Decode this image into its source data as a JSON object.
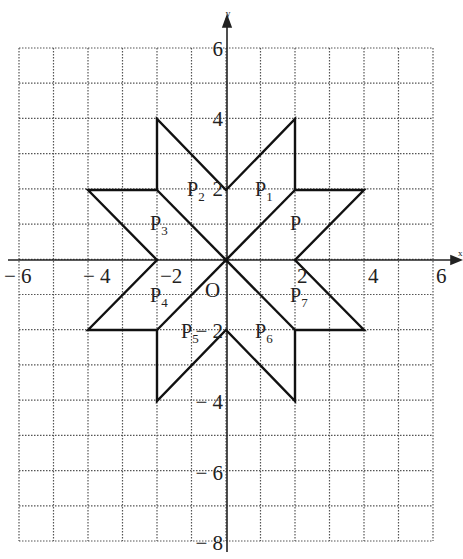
{
  "figure": {
    "type": "coordinate-grid-diagram",
    "x_axis": {
      "name": "x",
      "min": -6,
      "max": 6,
      "tick_labels": [
        "− 6",
        "− 4",
        "−2",
        "2",
        "4",
        "6"
      ],
      "tick_values": [
        -6,
        -4,
        -2,
        2,
        4,
        6
      ]
    },
    "y_axis": {
      "name": "y",
      "min": -8,
      "max": 6,
      "tick_labels": [
        "6",
        "4",
        "2",
        "− 2",
        "− 4",
        "− 6",
        "− 8"
      ],
      "tick_values": [
        6,
        4,
        2,
        -2,
        -4,
        -6,
        -8
      ]
    },
    "origin_label": "O",
    "grid": "dotted, 1 unit spacing",
    "star_outline": [
      [
        0,
        2
      ],
      [
        2,
        4
      ],
      [
        2,
        2
      ],
      [
        4,
        2
      ],
      [
        2,
        0
      ],
      [
        4,
        -2
      ],
      [
        2,
        -2
      ],
      [
        2,
        -4
      ],
      [
        0,
        -2
      ],
      [
        -2,
        -4
      ],
      [
        -2,
        -2
      ],
      [
        -4,
        -2
      ],
      [
        -2,
        0
      ],
      [
        -4,
        2
      ],
      [
        -2,
        2
      ],
      [
        -2,
        4
      ]
    ],
    "diagonals": [
      [
        [
          -2,
          -2
        ],
        [
          2,
          2
        ]
      ],
      [
        [
          -2,
          2
        ],
        [
          2,
          -2
        ]
      ]
    ],
    "region_labels": [
      {
        "name": "P",
        "sub": "1",
        "x": 1.2,
        "y": 2
      },
      {
        "name": "P",
        "sub": "",
        "x": 2.0,
        "y": 1
      },
      {
        "name": "P",
        "sub": "2",
        "x": -0.9,
        "y": 2
      },
      {
        "name": "P",
        "sub": "3",
        "x": -2.0,
        "y": 1
      },
      {
        "name": "P",
        "sub": "4",
        "x": -2.0,
        "y": -1
      },
      {
        "name": "P",
        "sub": "5",
        "x": -1.1,
        "y": -2
      },
      {
        "name": "P",
        "sub": "6",
        "x": 1.2,
        "y": -2
      },
      {
        "name": "P",
        "sub": "7",
        "x": 2.0,
        "y": -1
      }
    ]
  },
  "labels": {
    "x_axis_name": "x",
    "y_axis_name": "y",
    "origin": "O",
    "x_ticks": {
      "m6": "− 6",
      "m4": "− 4",
      "m2": "−2",
      "p2": "2",
      "p4": "4",
      "p6": "6"
    },
    "y_ticks": {
      "p6": "6",
      "p4": "4",
      "p2": "2",
      "m2": "− 2",
      "m4": "− 4",
      "m6": "− 6",
      "m8": "− 8"
    },
    "regions": {
      "p": "P",
      "p1": "P",
      "p1sub": "1",
      "p2": "P",
      "p2sub": "2",
      "p3": "P",
      "p3sub": "3",
      "p4": "P",
      "p4sub": "4",
      "p5": "P",
      "p5sub": "5",
      "p6": "P",
      "p6sub": "6",
      "p7": "P",
      "p7sub": "7"
    }
  }
}
